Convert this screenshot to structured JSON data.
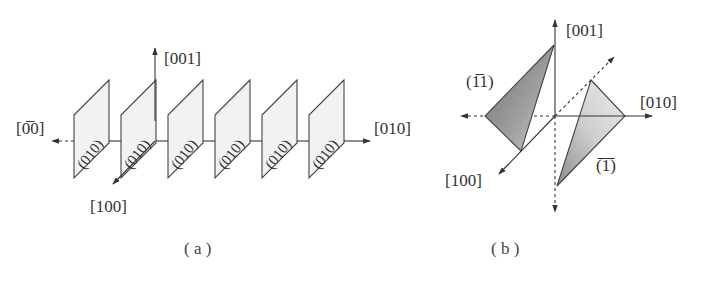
{
  "panel_a": {
    "caption": "( a )",
    "axes": {
      "up": "[001]",
      "right": "[010]",
      "left": "[0̅0]",
      "front": "[100]"
    },
    "planes": [
      {
        "label": "(010)"
      },
      {
        "label": "(010)"
      },
      {
        "label": "(010)"
      },
      {
        "label": "(010)"
      },
      {
        "label": "(010)"
      },
      {
        "label": "(010)"
      }
    ]
  },
  "panel_b": {
    "caption": "( b )",
    "axes": {
      "up": "[001]",
      "right": "[010]",
      "front": "[100]"
    },
    "planes": [
      {
        "label": "(1̅1)",
        "name": "plane-1-bar1-1",
        "shade": "#8a8a8a"
      },
      {
        "label": "(̅1̅)",
        "name": "plane-bar1-1-bar1",
        "shade": "#c4c4c4"
      }
    ]
  },
  "colors": {
    "line": "#333333",
    "plane_fill_a": "#f2f2f2",
    "plane_dark": "#8a8a8a",
    "plane_light": "#c4c4c4"
  }
}
